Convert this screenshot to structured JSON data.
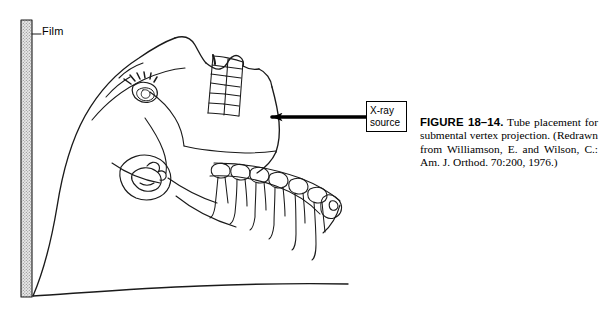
{
  "figure": {
    "background_color": "#ffffff",
    "line_color": "#1a1a1a",
    "film_fill_color": "#d9d9d9",
    "labels": {
      "film": "Film",
      "xray_source_line1": "X-ray",
      "xray_source_line2": "source"
    },
    "caption": {
      "figure_number": "FIGURE 18–14.",
      "text": " Tube placement for submental vertex projection. (Redrawn from Williamson, E. and Wilson, C.: Am. J. Orthod. 70:200, 1976.)"
    },
    "elements": {
      "film_cassette": "vertical stippled film cassette at left edge",
      "leader_line": "horizontal leader line from film to Film label",
      "arrow": "left-pointing arrow from X-ray source box to patient's jaw",
      "patient": "line drawing of head tilted back in profile, submental vertex position",
      "maxillary_teeth": "upper dental arch drawn as ladder of teeth",
      "mandibular_teeth": "lower dental arch with tooth roots",
      "eye": "eye with eyelashes",
      "ear": "external ear"
    }
  }
}
